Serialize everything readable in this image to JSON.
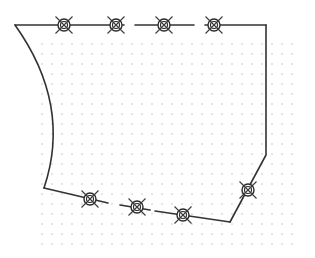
{
  "diagram": {
    "type": "floor-plan-outline",
    "colors": {
      "background": "#ffffff",
      "wall": "#333333",
      "grid_dot": "#b8b8b8",
      "fixture": "#2a2a2a"
    },
    "grid": {
      "x_start": 42,
      "x_end": 300,
      "y_start": 44,
      "y_end": 247,
      "spacing": 10
    },
    "walls": {
      "top_segments": [
        {
          "x1": 15,
          "y1": 25,
          "x2": 124,
          "y2": 25
        },
        {
          "x1": 135,
          "y1": 25,
          "x2": 194,
          "y2": 25
        },
        {
          "x1": 205,
          "y1": 25,
          "x2": 266,
          "y2": 25
        }
      ],
      "right_path": "M266,25 L266,155 L230,222",
      "bottom_segments": [
        {
          "x1": 230,
          "y1": 222,
          "x2": 155,
          "y2": 211
        },
        {
          "x1": 150,
          "y1": 210,
          "x2": 120,
          "y2": 205
        },
        {
          "x1": 108,
          "y1": 203,
          "x2": 44,
          "y2": 188
        }
      ],
      "left_arc_path": "M44,188 Q72,105 15,25"
    },
    "fixtures": [
      {
        "id": "fixture-top-1",
        "symbol": "ceiling-light-x-icon",
        "x": 64,
        "y": 25
      },
      {
        "id": "fixture-top-2",
        "symbol": "ceiling-light-x-icon",
        "x": 116,
        "y": 25
      },
      {
        "id": "fixture-top-3",
        "symbol": "ceiling-light-x-icon",
        "x": 164,
        "y": 25
      },
      {
        "id": "fixture-top-4",
        "symbol": "ceiling-light-x-icon",
        "x": 214,
        "y": 25
      },
      {
        "id": "fixture-right-diag",
        "symbol": "ceiling-light-x-icon",
        "x": 248,
        "y": 190
      },
      {
        "id": "fixture-bottom-1",
        "symbol": "ceiling-light-x-icon",
        "x": 183,
        "y": 215
      },
      {
        "id": "fixture-bottom-2",
        "symbol": "ceiling-light-x-icon",
        "x": 137,
        "y": 207
      },
      {
        "id": "fixture-bottom-3",
        "symbol": "ceiling-light-x-icon",
        "x": 90,
        "y": 199
      }
    ]
  }
}
